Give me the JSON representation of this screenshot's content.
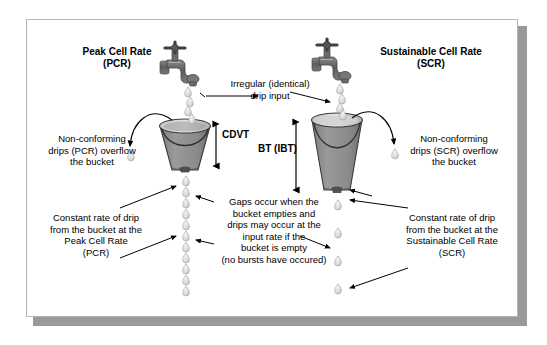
{
  "diagram": {
    "frame": {
      "border_color": "#b4b4b4",
      "shadow_color": "#9a9a9a",
      "background": "#ffffff"
    },
    "colors": {
      "bucket_fill": "#8f8f8f",
      "bucket_rim": "#bdbdbd",
      "bucket_outline": "#3a3a3a",
      "faucet": "#6e6e6e",
      "drip": "#d8d8d8",
      "drip_outline": "#9a9a9a",
      "arrow": "#000000",
      "text": "#000000"
    }
  },
  "labels": {
    "peak_cell_rate": "Peak Cell Rate\n(PCR)",
    "sustainable_cell_rate": "Sustainable Cell Rate\n(SCR)",
    "irregular_drip_input": "Irregular (identical)\ndrip input",
    "non_conforming_left": "Non-conforming\ndrips (PCR) overflow\nthe bucket",
    "non_conforming_right": "Non-conforming\ndrips (SCR) overflow\nthe bucket",
    "cdvt": "CDVT",
    "bt_ibt": "BT (IBT)",
    "constant_rate_left": "Constant rate of drip\nfrom the bucket at the\nPeak Cell Rate\n(PCR)",
    "constant_rate_right": "Constant rate of drip\nfrom the bucket at the\nSustainable Cell Rate\n(SCR)",
    "gaps_note": "Gaps occur when the\nbucket empties and\ndrips may occur at the\ninput rate if the\nbucket is empty\n(no bursts have occured)"
  },
  "icons": {
    "faucet_left": "faucet-icon",
    "faucet_right": "faucet-icon",
    "bucket_left": "bucket-icon",
    "bucket_right": "bucket-icon",
    "drip": "water-drop-icon",
    "cdvt_arrow": "double-headed-arrow-icon",
    "bt_arrow": "double-headed-arrow-icon"
  },
  "geometry": {
    "left_bucket": {
      "x": 159,
      "y": 118,
      "top_width": 52,
      "bottom_width": 38,
      "height": 48
    },
    "right_bucket": {
      "x": 311,
      "y": 112,
      "top_width": 52,
      "bottom_width": 38,
      "height": 74
    },
    "left_drip_column_x": 186,
    "right_drip_column_x": 338,
    "left_drip_spacing": 11,
    "right_drip_spacing": 28
  }
}
